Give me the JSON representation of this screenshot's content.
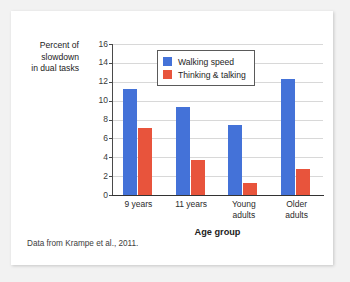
{
  "figure": {
    "footnote": "Data from Krampe et al., 2011."
  },
  "chart_data": {
    "type": "bar",
    "title": "",
    "categories": [
      "9 years",
      "11 years",
      "Young adults",
      "Older adults"
    ],
    "category_lines": [
      [
        "9 years"
      ],
      [
        "11 years"
      ],
      [
        "Young",
        "adults"
      ],
      [
        "Older",
        "adults"
      ]
    ],
    "series": [
      {
        "name": "Walking speed",
        "color": "#4472d8",
        "values": [
          11.2,
          9.3,
          7.4,
          12.3
        ]
      },
      {
        "name": "Thinking & talking",
        "color": "#e8543c",
        "values": [
          7.1,
          3.7,
          1.3,
          2.8
        ]
      }
    ],
    "xlabel": "Age group",
    "ylabel": "Percent of slowdown in dual tasks",
    "ylabel_lines": [
      "Percent of",
      "slowdown",
      "in dual tasks"
    ],
    "ylim": [
      0,
      16
    ],
    "yticks": [
      0,
      2,
      4,
      6,
      8,
      10,
      12,
      14,
      16
    ],
    "ytick_labels": [
      "0",
      "2",
      "4",
      "6",
      "8",
      "10",
      "12",
      "14",
      "16"
    ],
    "grid": true,
    "legend_position": "top-center"
  }
}
